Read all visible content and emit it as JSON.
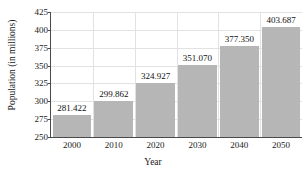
{
  "chart_data": {
    "type": "bar",
    "title": "",
    "xlabel": "Year",
    "ylabel": "Population (in millions)",
    "categories": [
      "2000",
      "2010",
      "2020",
      "2030",
      "2040",
      "2050"
    ],
    "values": [
      281.422,
      299.862,
      324.927,
      351.07,
      377.35,
      403.687
    ],
    "value_labels": [
      "281.422",
      "299.862",
      "324.927",
      "351.070",
      "377.350",
      "403.687"
    ],
    "ylim": [
      250,
      425
    ],
    "yticks": [
      "250",
      "275",
      "300",
      "325",
      "350",
      "375",
      "400",
      "425"
    ],
    "ytick_values": [
      250,
      275,
      300,
      325,
      350,
      375,
      400,
      425
    ],
    "grid": true,
    "legend": "none",
    "bar_color": "#b6b6b6",
    "grid_color": "#e2e2e2",
    "axis_color": "#4a4a4a",
    "text_color": "#1a1a1a"
  }
}
